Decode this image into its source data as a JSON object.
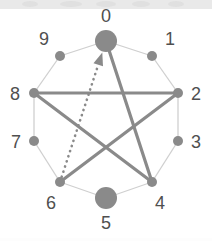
{
  "figure": {
    "type": "graph-diagram",
    "background_color": "#ffffff",
    "node_color": "#8a8a8a",
    "ring_edge_color": "#cfcfcf",
    "chord_edge_color": "#8a8a8a",
    "label_color": "#4f4f4f"
  },
  "nodes": [
    {
      "id": "0",
      "label": "0",
      "cx": 106,
      "cy": 41,
      "r": 11,
      "size": "large",
      "label_x": 106,
      "label_y": 17
    },
    {
      "id": "1",
      "label": "1",
      "cx": 152,
      "cy": 56,
      "r": 5,
      "size": "small",
      "label_x": 170,
      "label_y": 40
    },
    {
      "id": "2",
      "label": "2",
      "cx": 178,
      "cy": 93,
      "r": 5,
      "size": "small",
      "label_x": 196,
      "label_y": 95
    },
    {
      "id": "3",
      "label": "3",
      "cx": 178,
      "cy": 141,
      "r": 5,
      "size": "small",
      "label_x": 196,
      "label_y": 143
    },
    {
      "id": "4",
      "label": "4",
      "cx": 152,
      "cy": 182,
      "r": 5,
      "size": "small",
      "label_x": 160,
      "label_y": 204
    },
    {
      "id": "5",
      "label": "5",
      "cx": 106,
      "cy": 198,
      "r": 11,
      "size": "large",
      "label_x": 106,
      "label_y": 224
    },
    {
      "id": "6",
      "label": "6",
      "cx": 60,
      "cy": 182,
      "r": 5,
      "size": "small",
      "label_x": 51,
      "label_y": 204
    },
    {
      "id": "7",
      "label": "7",
      "cx": 34,
      "cy": 141,
      "r": 5,
      "size": "small",
      "label_x": 16,
      "label_y": 143
    },
    {
      "id": "8",
      "label": "8",
      "cx": 34,
      "cy": 93,
      "r": 5,
      "size": "small",
      "label_x": 15,
      "label_y": 95
    },
    {
      "id": "9",
      "label": "9",
      "cx": 60,
      "cy": 56,
      "r": 5,
      "size": "small",
      "label_x": 44,
      "label_y": 40
    }
  ],
  "ring_edges": [
    {
      "from": "0",
      "to": "1"
    },
    {
      "from": "1",
      "to": "2"
    },
    {
      "from": "2",
      "to": "3"
    },
    {
      "from": "3",
      "to": "4"
    },
    {
      "from": "4",
      "to": "5"
    },
    {
      "from": "5",
      "to": "6"
    },
    {
      "from": "6",
      "to": "7"
    },
    {
      "from": "7",
      "to": "8"
    },
    {
      "from": "8",
      "to": "9"
    },
    {
      "from": "9",
      "to": "0"
    }
  ],
  "chord_edges": [
    {
      "from": "8",
      "to": "2",
      "style": "thick-solid"
    },
    {
      "from": "8",
      "to": "4",
      "style": "thick-solid"
    },
    {
      "from": "2",
      "to": "6",
      "style": "thick-solid"
    },
    {
      "from": "0",
      "to": "4",
      "style": "thick-solid"
    }
  ],
  "directed_edges": [
    {
      "from": "6",
      "to": "0",
      "style": "dotted-arrow",
      "arrow_at": "0"
    }
  ],
  "top_band": {
    "color": "#e9e9e9",
    "smudges": [
      {
        "x": 22,
        "w": 16
      },
      {
        "x": 60,
        "w": 22
      },
      {
        "x": 96,
        "w": 20
      },
      {
        "x": 132,
        "w": 18
      },
      {
        "x": 168,
        "w": 16
      }
    ]
  }
}
